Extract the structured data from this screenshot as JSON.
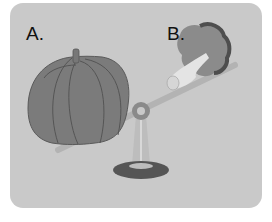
{
  "illustration": {
    "description": "Seesaw balance comparing two vegetables",
    "labels": {
      "a": "A.",
      "b": "B."
    },
    "objects": {
      "a": "pumpkin",
      "b": "broccoli"
    },
    "colors": {
      "background": "#ffffff",
      "card": "#c9c9c9",
      "pumpkin": "#7d7d7d",
      "pumpkin_lines": "#555555",
      "broccoli": "#8a8a8a",
      "broccoli_dark": "#5a5a5a",
      "stem": "#e6e6e6",
      "beam": "#b0b0b0",
      "base": "#555555"
    }
  }
}
